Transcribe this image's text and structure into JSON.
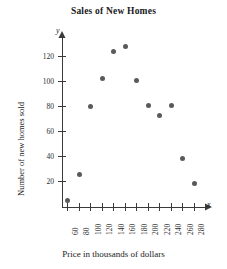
{
  "chart_data": {
    "type": "scatter",
    "title": "Sales of New Homes",
    "xlabel": "Price in thousands of dollars",
    "ylabel": "Number of new homes sold",
    "x_axis_letter": "x",
    "y_axis_letter": "y",
    "xlim": [
      50,
      290
    ],
    "ylim": [
      0,
      135
    ],
    "grid": false,
    "legend": null,
    "xticks": [
      60,
      80,
      100,
      120,
      140,
      160,
      180,
      200,
      220,
      240,
      260,
      280
    ],
    "xtick_labels": [
      "60",
      "80",
      "100",
      "120",
      "140",
      "160",
      "180",
      "200",
      "220",
      "240",
      "260",
      "280"
    ],
    "yticks": [
      20,
      40,
      60,
      80,
      100,
      120
    ],
    "ytick_labels": [
      "20",
      "40",
      "60",
      "80",
      "100",
      "120"
    ],
    "xtick_rotation": 90,
    "marker_color": "#5a5a5a",
    "points": [
      {
        "x": 60,
        "y": 5
      },
      {
        "x": 80,
        "y": 26
      },
      {
        "x": 100,
        "y": 80
      },
      {
        "x": 120,
        "y": 103
      },
      {
        "x": 140,
        "y": 124
      },
      {
        "x": 160,
        "y": 128
      },
      {
        "x": 180,
        "y": 101
      },
      {
        "x": 200,
        "y": 81
      },
      {
        "x": 220,
        "y": 73
      },
      {
        "x": 240,
        "y": 81
      },
      {
        "x": 260,
        "y": 39
      },
      {
        "x": 280,
        "y": 19
      }
    ]
  }
}
